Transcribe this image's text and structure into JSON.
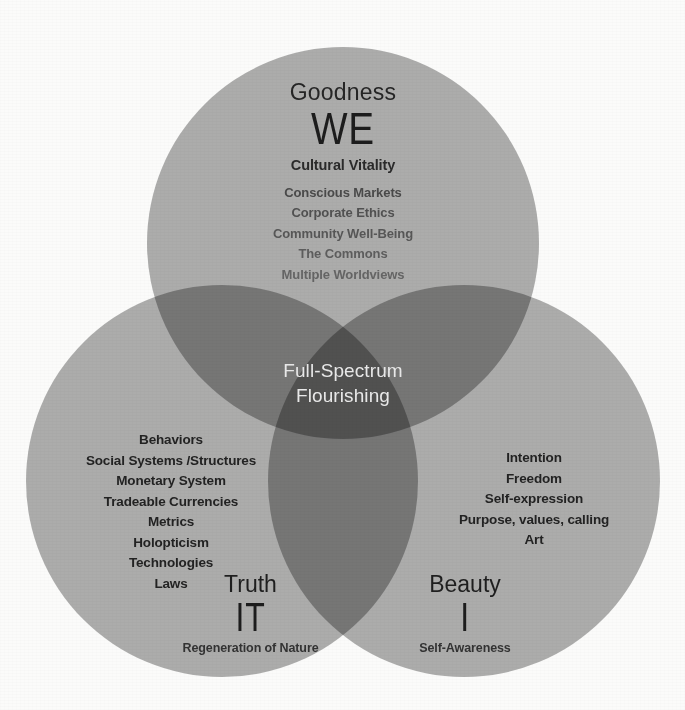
{
  "diagram": {
    "center_label_line1": "Full-Spectrum",
    "center_label_line2": "Flourishing",
    "colors": {
      "background": "#fbfbfa",
      "circle_fill": "#7e7e7e",
      "single_overlap": "#8e8e8e",
      "double_overlap": "#6a6a6a",
      "triple_overlap": "#4a4a4a",
      "dark_text": "#232323",
      "muted_text": "#575757",
      "center_text": "#e9e9e9"
    },
    "circles": [
      {
        "id": "goodness",
        "title": "Goodness",
        "pronoun": "WE",
        "headline": "Cultural Vitality",
        "items": [
          "Conscious Markets",
          "Corporate Ethics",
          "Community Well-Being",
          "The Commons",
          "Multiple Worldviews"
        ]
      },
      {
        "id": "truth",
        "title": "Truth",
        "pronoun": "IT",
        "caption": "Regeneration of Nature",
        "items": [
          "Behaviors",
          "Social Systems /Structures",
          "Monetary System",
          "Tradeable Currencies",
          "Metrics",
          "Holopticism",
          "Technologies",
          "Laws"
        ]
      },
      {
        "id": "beauty",
        "title": "Beauty",
        "pronoun": "I",
        "caption": "Self-Awareness",
        "items": [
          "Intention",
          "Freedom",
          "Self-expression",
          "Purpose, values, calling",
          "Art"
        ]
      }
    ]
  }
}
